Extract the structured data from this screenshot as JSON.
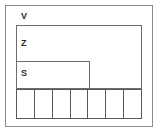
{
  "diagram": {
    "type": "nested-region-diagram",
    "background_color": "#ffffff",
    "regions": [
      {
        "id": "V",
        "label": "V",
        "role": "outer-frame",
        "border_color": "#8a8a8a",
        "x": 5,
        "y": 5,
        "width": 148,
        "height": 122
      },
      {
        "id": "Z",
        "label": "Z",
        "role": "middle-box",
        "border_color": "#6d6d6d",
        "x": 16,
        "y": 25,
        "width": 126,
        "height": 64
      },
      {
        "id": "S",
        "label": "S",
        "role": "inner-box",
        "border_color": "#6d6d6d",
        "x": 16,
        "y": 61,
        "width": 74,
        "height": 28
      }
    ],
    "cell_row": {
      "role": "bottom-cell-strip",
      "border_color": "#5a5a5a",
      "x": 16,
      "y": 89,
      "width": 126,
      "height": 30,
      "cell_count": 7,
      "cells": [
        {
          "label": ""
        },
        {
          "label": ""
        },
        {
          "label": ""
        },
        {
          "label": ""
        },
        {
          "label": ""
        },
        {
          "label": ""
        },
        {
          "label": ""
        }
      ]
    }
  }
}
